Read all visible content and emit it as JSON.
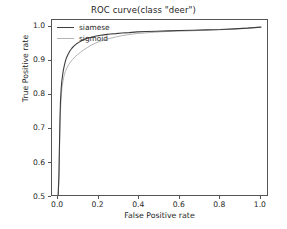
{
  "chart_data": {
    "type": "line",
    "title": "ROC curve(class \"deer\")",
    "xlabel": "False Positive rate",
    "ylabel": "True Positive rate",
    "xlim": [
      -0.03,
      1.04
    ],
    "ylim": [
      0.5,
      1.02
    ],
    "grid": false,
    "legend_position": "upper-left",
    "xticks": [
      0.0,
      0.2,
      0.4,
      0.6,
      0.8,
      1.0
    ],
    "xtick_labels": [
      "0.0",
      "0.2",
      "0.4",
      "0.6",
      "0.8",
      "1.0"
    ],
    "yticks": [
      0.5,
      0.6,
      0.7,
      0.8,
      0.9,
      1.0
    ],
    "ytick_labels": [
      "0.5",
      "0.6",
      "0.7",
      "0.8",
      "0.9",
      "1.0"
    ],
    "series": [
      {
        "name": "siamese",
        "color": "#3d3d3d",
        "x": [
          0.0,
          0.004,
          0.006,
          0.008,
          0.01,
          0.012,
          0.015,
          0.018,
          0.022,
          0.026,
          0.031,
          0.036,
          0.042,
          0.05,
          0.058,
          0.068,
          0.079,
          0.091,
          0.104,
          0.118,
          0.133,
          0.15,
          0.168,
          0.188,
          0.21,
          0.233,
          0.258,
          0.285,
          0.315,
          0.35,
          0.39,
          0.435,
          0.485,
          0.54,
          0.6,
          0.665,
          0.73,
          0.8,
          0.87,
          0.935,
          1.0
        ],
        "y": [
          0.5,
          0.56,
          0.625,
          0.69,
          0.745,
          0.785,
          0.815,
          0.838,
          0.857,
          0.873,
          0.887,
          0.899,
          0.91,
          0.92,
          0.929,
          0.937,
          0.944,
          0.95,
          0.955,
          0.96,
          0.964,
          0.967,
          0.97,
          0.973,
          0.975,
          0.977,
          0.979,
          0.98,
          0.982,
          0.983,
          0.985,
          0.986,
          0.987,
          0.988,
          0.989,
          0.99,
          0.991,
          0.992,
          0.994,
          0.996,
          0.999
        ]
      },
      {
        "name": "sigmoid",
        "color": "#b4b4b4",
        "x": [
          0.0,
          0.004,
          0.006,
          0.008,
          0.01,
          0.013,
          0.016,
          0.02,
          0.025,
          0.03,
          0.036,
          0.043,
          0.051,
          0.06,
          0.07,
          0.082,
          0.095,
          0.11,
          0.126,
          0.144,
          0.163,
          0.184,
          0.206,
          0.23,
          0.256,
          0.284,
          0.314,
          0.348,
          0.385,
          0.428,
          0.475,
          0.528,
          0.585,
          0.648,
          0.715,
          0.785,
          0.855,
          0.925,
          1.0
        ],
        "y": [
          0.5,
          0.548,
          0.61,
          0.672,
          0.725,
          0.768,
          0.8,
          0.824,
          0.843,
          0.857,
          0.869,
          0.879,
          0.888,
          0.896,
          0.903,
          0.911,
          0.918,
          0.925,
          0.932,
          0.939,
          0.946,
          0.952,
          0.957,
          0.962,
          0.966,
          0.97,
          0.974,
          0.977,
          0.98,
          0.982,
          0.984,
          0.986,
          0.987,
          0.988,
          0.99,
          0.991,
          0.993,
          0.996,
          0.999
        ]
      }
    ]
  },
  "legend": {
    "entries": [
      {
        "label": "siamese",
        "color": "#3d3d3d"
      },
      {
        "label": "sigmoid",
        "color": "#b4b4b4"
      }
    ]
  }
}
